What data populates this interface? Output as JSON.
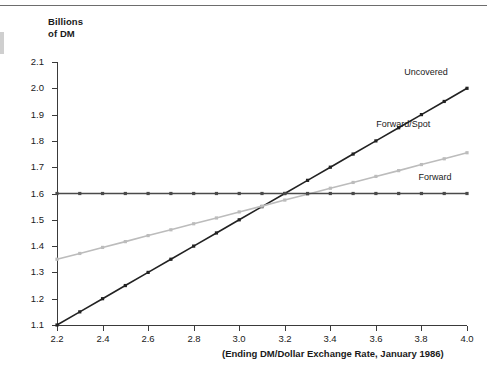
{
  "figure": {
    "has_top_rule": true,
    "background": "#ffffff"
  },
  "chart_data": {
    "type": "line",
    "title": "",
    "subtitle": "",
    "ylabel": "Billions\nof DM",
    "xlabel": "(Ending DM/Dollar Exchange Rate, January 1986)",
    "xlim": [
      2.2,
      4.0
    ],
    "ylim": [
      1.1,
      2.1
    ],
    "grid": false,
    "legend_position": "inline-right",
    "x_tick_labels": [
      "2.2",
      "2.4",
      "2.6",
      "2.8",
      "3.0",
      "3.2",
      "3.4",
      "3.6",
      "3.8",
      "4.0"
    ],
    "x_tick_values": [
      2.2,
      2.4,
      2.6,
      2.8,
      3.0,
      3.2,
      3.4,
      3.6,
      3.8,
      4.0
    ],
    "y_tick_labels": [
      "1.1",
      "1.2",
      "1.3",
      "1.4",
      "1.5",
      "1.6",
      "1.7",
      "1.8",
      "1.9",
      "2.0",
      "2.1"
    ],
    "y_tick_values": [
      1.1,
      1.2,
      1.3,
      1.4,
      1.5,
      1.6,
      1.7,
      1.8,
      1.9,
      2.0,
      2.1
    ],
    "x": [
      2.2,
      2.3,
      2.4,
      2.5,
      2.6,
      2.7,
      2.8,
      2.9,
      3.0,
      3.1,
      3.2,
      3.3,
      3.4,
      3.5,
      3.6,
      3.7,
      3.8,
      3.9,
      4.0
    ],
    "series": [
      {
        "name": "Uncovered",
        "color": "#222222",
        "marker": "square",
        "values": [
          1.1,
          1.15,
          1.2,
          1.25,
          1.3,
          1.35,
          1.4,
          1.45,
          1.5,
          1.55,
          1.6,
          1.65,
          1.7,
          1.75,
          1.8,
          1.85,
          1.9,
          1.95,
          2.0
        ]
      },
      {
        "name": "Forward/Spot",
        "color": "#bcbcbc",
        "marker": "square",
        "values": [
          1.35,
          1.372,
          1.395,
          1.417,
          1.44,
          1.462,
          1.485,
          1.507,
          1.53,
          1.552,
          1.575,
          1.597,
          1.62,
          1.642,
          1.665,
          1.687,
          1.71,
          1.732,
          1.755
        ]
      },
      {
        "name": "Forward",
        "color": "#4a4a4a",
        "marker": "square",
        "values": [
          1.6,
          1.6,
          1.6,
          1.6,
          1.6,
          1.6,
          1.6,
          1.6,
          1.6,
          1.6,
          1.6,
          1.6,
          1.6,
          1.6,
          1.6,
          1.6,
          1.6,
          1.6,
          1.6
        ]
      }
    ],
    "annotations": [
      {
        "text": "Uncovered",
        "x": 3.82,
        "y": 2.055
      },
      {
        "text": "Forward/Spot",
        "x": 3.72,
        "y": 1.855
      },
      {
        "text": "Forward",
        "x": 3.86,
        "y": 1.655
      }
    ],
    "crossing_point": {
      "x": 3.2,
      "y": 1.6
    }
  }
}
